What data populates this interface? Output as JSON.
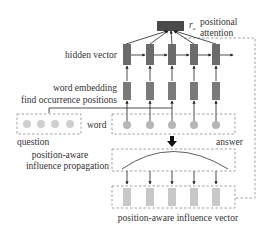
{
  "diagram": {
    "labels": {
      "positional_attention_line1": "positional",
      "positional_attention_line2": "attention",
      "ra": "r",
      "ra_sub": "a",
      "hidden_vector": "hidden vector",
      "word_embedding": "word embedding",
      "find_positions": "find occurrence positions",
      "word": "word",
      "question": "question",
      "answer": "answer",
      "propagation_line1": "position-aware",
      "propagation_line2": "influence propagation",
      "influence_vector": "position-aware influence vector"
    },
    "colors": {
      "attention_box": "#4a4a4a",
      "hidden": "#6b6b6b",
      "embedding": "#7a7a7a",
      "word_circle": "#b5b5b5",
      "question_circle": "#cfcfcf",
      "influence_bar": "#c8c8c8",
      "dashed": "#8a8a8a",
      "arrow": "#222222"
    },
    "columns": 5,
    "question_words": 4
  }
}
